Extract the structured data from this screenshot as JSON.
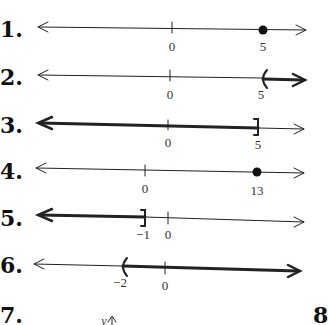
{
  "problems": [
    {
      "number": "1.",
      "ticks": [
        {
          "label": "0"
        },
        {
          "label": "5"
        }
      ],
      "graph": "closed dot at 5"
    },
    {
      "number": "2.",
      "ticks": [
        {
          "label": "0"
        },
        {
          "label": "5"
        }
      ],
      "graph": "open interval (5, ∞)"
    },
    {
      "number": "3.",
      "ticks": [
        {
          "label": "0"
        },
        {
          "label": "5"
        }
      ],
      "graph": "interval (−∞, 5]"
    },
    {
      "number": "4.",
      "ticks": [
        {
          "label": "0"
        },
        {
          "label": "13"
        }
      ],
      "graph": "closed dot at 13"
    },
    {
      "number": "5.",
      "ticks": [
        {
          "label": "-1"
        },
        {
          "label": "0"
        }
      ],
      "graph": "interval (−∞, −1]"
    },
    {
      "number": "6.",
      "ticks": [
        {
          "label": "-2"
        },
        {
          "label": "0"
        }
      ],
      "graph": "interval (−2, ∞)"
    },
    {
      "number": "7.",
      "axis_label": "y"
    },
    {
      "number": "8"
    }
  ],
  "labels": {
    "p1_a": "0",
    "p1_b": "5",
    "p2_a": "0",
    "p2_b": "5",
    "p3_a": "0",
    "p3_b": "5",
    "p4_a": "0",
    "p4_b": "13",
    "p5_a": "−1",
    "p5_b": "0",
    "p6_a": "−2",
    "p6_b": "0",
    "p7_y": "y"
  },
  "colors": {
    "ink": "#222222",
    "background": "#ffffff"
  }
}
